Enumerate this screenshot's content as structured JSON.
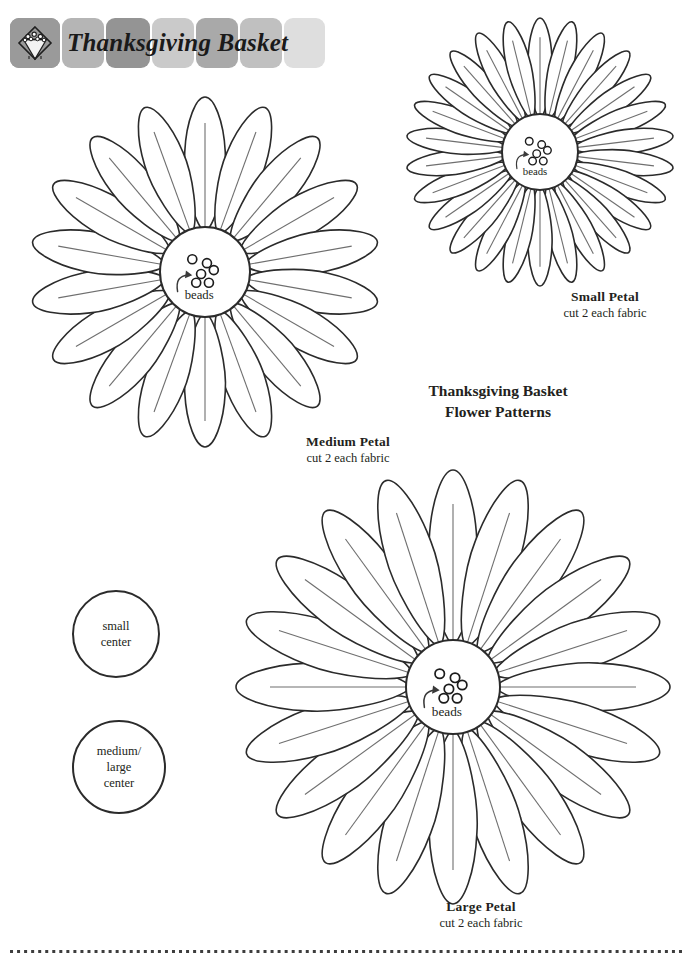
{
  "header": {
    "title": "Thanksgiving Basket",
    "logo_icon": "basket-diamond-logo-icon",
    "tiles": [
      {
        "name": "tile-1",
        "color": "#9a9a9a",
        "x": 0,
        "w": 50
      },
      {
        "name": "tile-2",
        "color": "#b5b5b5",
        "x": 52,
        "w": 42
      },
      {
        "name": "tile-3",
        "color": "#949494",
        "x": 96,
        "w": 44
      },
      {
        "name": "tile-4",
        "color": "#cacaca",
        "x": 142,
        "w": 42
      },
      {
        "name": "tile-5",
        "color": "#a9a9a9",
        "x": 186,
        "w": 42
      },
      {
        "name": "tile-6",
        "color": "#c0c0c0",
        "x": 230,
        "w": 42
      },
      {
        "name": "tile-7",
        "color": "#dedede",
        "x": 274,
        "w": 41
      }
    ]
  },
  "page_title": {
    "line1": "Thanksgiving Basket",
    "line2": "Flower Patterns"
  },
  "flowers": [
    {
      "id": "medium",
      "name": "medium-flower",
      "petal_count": 18,
      "cx": 205,
      "cy": 272,
      "center_r": 45,
      "petal_len": 130,
      "petal_w": 44,
      "bead_label": "beads",
      "label": {
        "name": "Medium Petal",
        "sub": "cut 2 each fabric",
        "x": 250,
        "y": 434,
        "w": 196
      }
    },
    {
      "id": "small",
      "name": "small-flower",
      "petal_count": 26,
      "cx": 540,
      "cy": 152,
      "center_r": 38,
      "petal_len": 96,
      "petal_w": 26,
      "bead_label": "beads",
      "label": {
        "name": "Small Petal",
        "sub": "cut 2 each fabric",
        "x": 507,
        "y": 289,
        "w": 196
      }
    },
    {
      "id": "large",
      "name": "large-flower",
      "petal_count": 20,
      "cx": 453,
      "cy": 687,
      "center_r": 47,
      "petal_len": 170,
      "petal_w": 52,
      "bead_label": "beads",
      "label": {
        "name": "Large Petal",
        "sub": "cut 2 each fabric",
        "x": 383,
        "y": 899,
        "w": 196
      }
    }
  ],
  "centers": [
    {
      "id": "small-center",
      "name": "small-center-template",
      "x": 72,
      "y": 590,
      "d": 88,
      "lines": [
        "small",
        "center"
      ]
    },
    {
      "id": "medium-large-center",
      "name": "medium-large-center-template",
      "x": 72,
      "y": 720,
      "d": 94,
      "lines": [
        "medium/",
        "large",
        "center"
      ]
    }
  ],
  "footer": {
    "dot_color": "#3d3d3d",
    "dot_count": 96
  },
  "colors": {
    "ink": "#231f20",
    "outline": "#2b2b2b",
    "vein": "#6f6f6f",
    "paper": "#ffffff"
  }
}
